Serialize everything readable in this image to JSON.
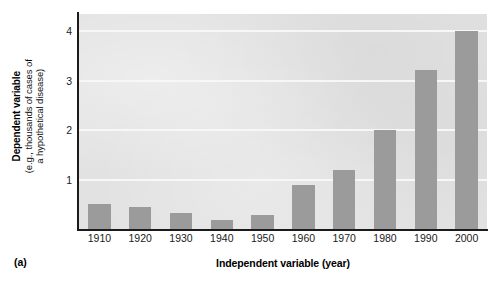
{
  "chart_data": {
    "type": "bar",
    "title": "",
    "panel_label": "(a)",
    "categories": [
      "1910",
      "1920",
      "1930",
      "1940",
      "1950",
      "1960",
      "1970",
      "1980",
      "1990",
      "2000"
    ],
    "values": [
      0.5,
      0.45,
      0.33,
      0.18,
      0.28,
      0.9,
      1.2,
      2.0,
      3.22,
      4.0
    ],
    "xlabel": "Independent variable (year)",
    "ylabel": "Dependent variable",
    "ylabel_sub_line1": "(e.g., thousands of cases of",
    "ylabel_sub_line2": "a hypothetical disease)",
    "yticks": [
      "1",
      "2",
      "3",
      "4"
    ],
    "ytick_values": [
      1,
      2,
      3,
      4
    ],
    "ylim": [
      0,
      4.35
    ],
    "xtick_labels": [
      "1910",
      "1920",
      "1930",
      "1940",
      "1950",
      "1960",
      "1970",
      "1980",
      "1990",
      "2000"
    ],
    "grid": true,
    "grid_orientation": "horizontal",
    "legend": "none",
    "bar_color": "#9b9b9b",
    "plot_background": "#e2e2e2",
    "gridline_color": "#f7f7f7",
    "axis_color": "#1b1b1b",
    "figure_background": "#ffffff"
  }
}
